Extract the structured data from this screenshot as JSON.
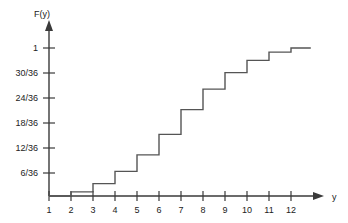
{
  "chart_data": {
    "type": "line",
    "subtype": "step-cdf",
    "title": "",
    "xlabel": "y",
    "ylabel": "F(y)",
    "xlim": [
      1,
      12.6
    ],
    "ylim": [
      0,
      1.03
    ],
    "grid": false,
    "legend": null,
    "x_tick_labels": [
      "1",
      "2",
      "3",
      "4",
      "5",
      "6",
      "7",
      "8",
      "9",
      "10",
      "11",
      "12"
    ],
    "x_tick_values": [
      1,
      2,
      3,
      4,
      5,
      6,
      7,
      8,
      9,
      10,
      11,
      12
    ],
    "y_tick_labels": [
      "6/36",
      "12/36",
      "18/36",
      "24/36",
      "30/36",
      "1"
    ],
    "y_tick_values": [
      0.16667,
      0.33333,
      0.5,
      0.66667,
      0.83333,
      1.0
    ],
    "x": [
      2,
      3,
      4,
      5,
      6,
      7,
      8,
      9,
      10,
      11,
      12
    ],
    "values": [
      0.02778,
      0.08333,
      0.16667,
      0.27778,
      0.41667,
      0.58333,
      0.72222,
      0.83333,
      0.91667,
      0.97222,
      1.0
    ],
    "value_fractions": [
      "1/36",
      "3/36",
      "6/36",
      "10/36",
      "15/36",
      "21/36",
      "26/36",
      "30/36",
      "33/36",
      "35/36",
      "36/36"
    ],
    "line_color": "#555555",
    "axis_color": "#3a3a3a",
    "background_color": "#ffffff"
  },
  "axes": {
    "y_axis_label": "F(y)",
    "x_axis_label": "y"
  }
}
